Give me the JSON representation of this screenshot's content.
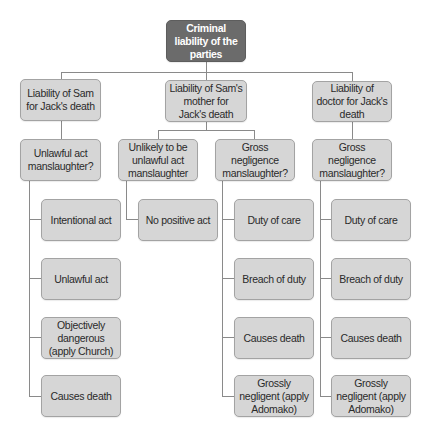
{
  "diagram": {
    "type": "tree",
    "colors": {
      "root_fill": "#6b6b6b",
      "node_fill": "#d6d6d6",
      "node_border": "#a3a3a3",
      "connector": "#8a8a8a",
      "root_text": "#ffffff",
      "node_text": "#2a2a2a"
    },
    "root": {
      "label": "Criminal liability of the parties"
    },
    "branches": [
      {
        "label": "Liability of Sam for Jack's death",
        "offences": [
          {
            "label": "Unlawful act manslaughter?",
            "elements": [
              "Intentional act",
              "Unlawful act",
              "Objectively dangerous (apply Church)",
              "Causes death"
            ]
          }
        ]
      },
      {
        "label": "Liability of Sam's mother for Jack's death",
        "offences": [
          {
            "label": "Unlikely to be unlawful act manslaughter",
            "elements": [
              "No positive act"
            ]
          },
          {
            "label": "Gross negligence manslaughter?",
            "elements": [
              "Duty of care",
              "Breach of duty",
              "Causes death",
              "Grossly negligent (apply Adomako)"
            ]
          }
        ]
      },
      {
        "label": "Liability of doctor for Jack's death",
        "offences": [
          {
            "label": "Gross negligence manslaughter?",
            "elements": [
              "Duty of care",
              "Breach of duty",
              "Causes death",
              "Grossly negligent (apply Adomako)"
            ]
          }
        ]
      }
    ]
  }
}
